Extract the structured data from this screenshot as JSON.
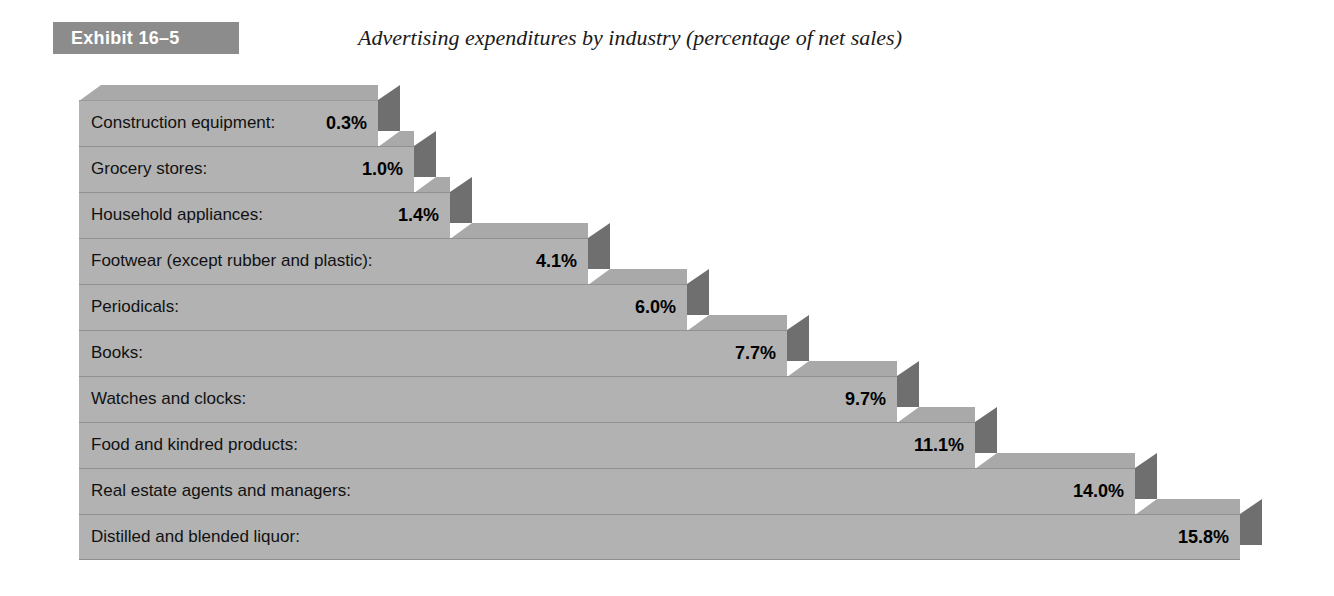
{
  "header": {
    "badge_label": "Exhibit 16–5",
    "title": "Advertising expenditures by industry (percentage of net sales)",
    "badge_color": "#8c8c8c",
    "badge_text_color": "#ffffff"
  },
  "colors": {
    "bar_front": "#b2b2b2",
    "bar_side": "#6f6f6f",
    "bar_top": "#a9a9a9",
    "separator": "#919191",
    "background": "#ffffff",
    "text": "#111111"
  },
  "chart_data": {
    "type": "bar",
    "orientation": "horizontal",
    "style": "3d-stepped-blocks",
    "title": "Advertising expenditures by industry (percentage of net sales)",
    "xlabel": "",
    "ylabel": "",
    "unit": "%",
    "grid": false,
    "legend": null,
    "xlim": [
      0,
      15.8
    ],
    "categories": [
      "Construction equipment:",
      "Grocery stores:",
      "Household appliances:",
      "Footwear (except rubber and plastic):",
      "Periodicals:",
      "Books:",
      "Watches and clocks:",
      "Food and kindred products:",
      "Real estate agents and managers:",
      "Distilled and blended liquor:"
    ],
    "values": [
      0.3,
      1.0,
      1.4,
      4.1,
      6.0,
      7.7,
      9.7,
      11.1,
      14.0,
      15.8
    ],
    "value_labels": [
      "0.3%",
      "1.0%",
      "1.4%",
      "4.1%",
      "6.0%",
      "7.7%",
      "9.7%",
      "11.1%",
      "14.0%",
      "15.8%"
    ]
  },
  "bars": [
    {
      "label": "Construction equipment:",
      "value_label": "0.3%",
      "width": 299
    },
    {
      "label": "Grocery stores:",
      "value_label": "1.0%",
      "width": 335
    },
    {
      "label": "Household appliances:",
      "value_label": "1.4%",
      "width": 371
    },
    {
      "label": "Footwear (except rubber and plastic):",
      "value_label": "4.1%",
      "width": 509
    },
    {
      "label": "Periodicals:",
      "value_label": "6.0%",
      "width": 608
    },
    {
      "label": "Books:",
      "value_label": "7.7%",
      "width": 708
    },
    {
      "label": "Watches and clocks:",
      "value_label": "9.7%",
      "width": 818
    },
    {
      "label": "Food and kindred products:",
      "value_label": "11.1%",
      "width": 896
    },
    {
      "label": "Real estate agents and managers:",
      "value_label": "14.0%",
      "width": 1056
    },
    {
      "label": "Distilled and blended liquor:",
      "value_label": "15.8%",
      "width": 1161
    }
  ]
}
